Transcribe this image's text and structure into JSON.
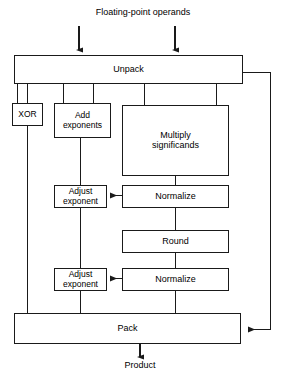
{
  "diagram": {
    "input_label": "Floating-point operands",
    "output_label": "Product",
    "stroke_color": "#1a1a1a",
    "fill_color": "#ffffff",
    "text_color": "#000000",
    "nodes": {
      "unpack": {
        "label": "Unpack"
      },
      "xor": {
        "label": "XOR"
      },
      "add_exponents": {
        "label": "Add\nexponents"
      },
      "multiply_significands": {
        "label": "Multiply\nsignificands"
      },
      "adjust_exponent_1": {
        "label": "Adjust\nexponent"
      },
      "normalize_1": {
        "label": "Normalize"
      },
      "round": {
        "label": "Round"
      },
      "adjust_exponent_2": {
        "label": "Adjust\nexponent"
      },
      "normalize_2": {
        "label": "Normalize"
      },
      "pack": {
        "label": "Pack"
      }
    },
    "edges": [
      {
        "name": "operand-a-to-unpack",
        "from": "operands",
        "to": "unpack"
      },
      {
        "name": "operand-b-to-unpack",
        "from": "operands",
        "to": "unpack"
      },
      {
        "name": "unpack-to-xor",
        "from": "unpack",
        "to": "xor"
      },
      {
        "name": "unpack-to-add-exponents",
        "from": "unpack",
        "to": "add_exponents"
      },
      {
        "name": "unpack-to-multiply-significands",
        "from": "unpack",
        "to": "multiply_significands"
      },
      {
        "name": "unpack-to-pack-bypass",
        "from": "unpack",
        "to": "pack"
      },
      {
        "name": "xor-to-pack",
        "from": "xor",
        "to": "pack"
      },
      {
        "name": "add-exponents-to-adjust-exponent-1",
        "from": "add_exponents",
        "to": "adjust_exponent_1"
      },
      {
        "name": "multiply-significands-to-normalize-1",
        "from": "multiply_significands",
        "to": "normalize_1"
      },
      {
        "name": "normalize-1-to-adjust-exponent-1",
        "from": "normalize_1",
        "to": "adjust_exponent_1"
      },
      {
        "name": "normalize-1-to-round",
        "from": "normalize_1",
        "to": "round"
      },
      {
        "name": "round-to-normalize-2",
        "from": "round",
        "to": "normalize_2"
      },
      {
        "name": "normalize-2-to-adjust-exponent-2",
        "from": "normalize_2",
        "to": "adjust_exponent_2"
      },
      {
        "name": "adjust-exponent-1-to-adjust-exponent-2",
        "from": "adjust_exponent_1",
        "to": "adjust_exponent_2"
      },
      {
        "name": "adjust-exponent-2-to-pack",
        "from": "adjust_exponent_2",
        "to": "pack"
      },
      {
        "name": "normalize-2-to-pack",
        "from": "normalize_2",
        "to": "pack"
      },
      {
        "name": "pack-to-product",
        "from": "pack",
        "to": "product"
      }
    ]
  }
}
